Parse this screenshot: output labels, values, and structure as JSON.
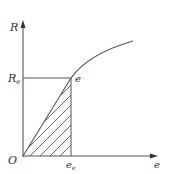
{
  "diagram": {
    "axes": {
      "y_label": "R",
      "x_label": "e",
      "origin_label": "O"
    },
    "points": {
      "yield_point_label": "e",
      "y_marker_label": "R",
      "y_marker_sub": "e",
      "x_marker_label": "e",
      "x_marker_sub": "e"
    },
    "colors": {
      "line": "#555555",
      "text": "#333333",
      "background": "#ffffff"
    }
  }
}
